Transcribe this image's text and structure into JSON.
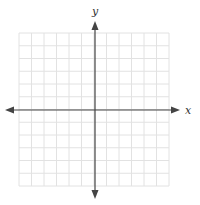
{
  "figure": {
    "type": "coordinate-plane",
    "x_label": "x",
    "y_label": "y",
    "grid": {
      "columns": 12,
      "rows": 12,
      "left": 19,
      "top": 33,
      "right": 169,
      "bottom": 186,
      "line_color": "#e2e2e2"
    },
    "axes": {
      "origin_x": 95,
      "origin_y": 110,
      "x_start": 5,
      "x_end": 180,
      "y_start": 21,
      "y_end": 199,
      "color": "#444444"
    }
  }
}
